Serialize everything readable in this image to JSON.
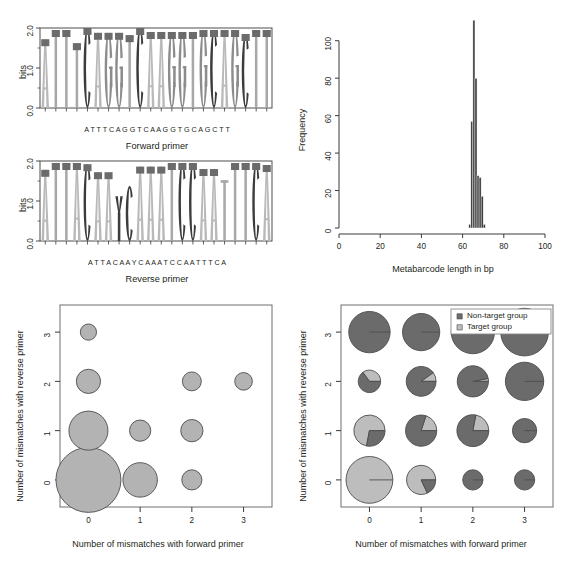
{
  "figure": {
    "title": "",
    "panels": [
      "sequence-logos",
      "metabarcode-length-histogram",
      "mismatch-bubble-plot",
      "mismatch-pie-plot"
    ]
  },
  "colors": {
    "base_A": "#b9b9b9",
    "base_T": "#a8a8a8",
    "base_C": "#3c3c3c",
    "base_G": "#8c8c8c",
    "base_Y": "#3c3c3c",
    "logo_box_cap": "#6b6b6b",
    "histogram_bar": "#3a3a3a",
    "bubble_fill": "#b3b3b3",
    "bubble_stroke": "#4d4d4d",
    "non_target": "#6b6b6b",
    "target": "#bdbdbd",
    "axis": "#3a3a3a",
    "text": "#231f20"
  },
  "logo_forward": {
    "caption": "Forward primer",
    "ylabel": "bits",
    "yticks": [
      "0.0",
      "1.0",
      "2.0"
    ],
    "ymax": 2.0,
    "sequence": [
      "A",
      "T",
      "T",
      "T",
      "C",
      "A",
      "G",
      "G",
      "T",
      "C",
      "A",
      "A",
      "G",
      "G",
      "T",
      "G",
      "C",
      "A",
      "G",
      "C",
      "T",
      "T"
    ],
    "sequence_text": "A T T T C A G G T C A A G G T G C A G C T T",
    "bits": [
      1.72,
      1.95,
      1.95,
      1.62,
      2.0,
      1.88,
      1.88,
      1.88,
      1.82,
      2.0,
      1.9,
      1.9,
      1.9,
      1.9,
      1.9,
      1.95,
      1.95,
      1.95,
      1.95,
      1.85,
      1.95,
      1.95
    ]
  },
  "logo_reverse": {
    "caption": "Reverse primer",
    "ylabel": "bits",
    "yticks": [
      "0.0",
      "1.0",
      "2.0"
    ],
    "ymax": 2.0,
    "sequence": [
      "A",
      "T",
      "T",
      "A",
      "C",
      "A",
      "A",
      "Y",
      "C",
      "A",
      "A",
      "A",
      "T",
      "C",
      "C",
      "A",
      "A",
      "T",
      "T",
      "T",
      "C",
      "A"
    ],
    "sequence_text": "A T T A C A A Y C A A A T C C A A T T T C A",
    "bits": [
      1.78,
      1.95,
      1.95,
      1.95,
      1.92,
      1.72,
      1.72,
      1.12,
      1.38,
      1.86,
      1.86,
      1.86,
      1.95,
      1.95,
      1.95,
      1.8,
      1.8,
      1.52,
      1.95,
      1.95,
      1.95,
      1.9
    ]
  },
  "chart_data": [
    {
      "type": "bar",
      "name": "metabarcode-length-histogram",
      "title": "",
      "xlabel": "Metabarcode length in bp",
      "ylabel": "Frequency",
      "xlim": [
        0,
        100
      ],
      "ylim": [
        0,
        110
      ],
      "xticks": [
        0,
        20,
        40,
        60,
        80,
        100
      ],
      "yticks": [
        0,
        20,
        40,
        60,
        80,
        100
      ],
      "grid": false,
      "categories": [
        63,
        64,
        65,
        66,
        67,
        68,
        69,
        70
      ],
      "values": [
        2,
        57,
        111,
        80,
        28,
        27,
        17,
        2
      ],
      "bin_width": 1
    },
    {
      "type": "scatter",
      "name": "mismatch-bubble-plot",
      "title": "",
      "xlabel": "Number of mismatches with forward primer",
      "ylabel": "Number of mismatches with reverse primer",
      "xlim": [
        -0.55,
        3.55
      ],
      "ylim": [
        -0.55,
        3.55
      ],
      "xticks": [
        0,
        1,
        2,
        3
      ],
      "yticks": [
        0,
        1,
        2,
        3
      ],
      "grid": false,
      "points": [
        {
          "x": 0,
          "y": 0,
          "size": 100
        },
        {
          "x": 1,
          "y": 0,
          "size": 25
        },
        {
          "x": 2,
          "y": 0,
          "size": 7
        },
        {
          "x": 0,
          "y": 1,
          "size": 33
        },
        {
          "x": 1,
          "y": 1,
          "size": 8
        },
        {
          "x": 2,
          "y": 1,
          "size": 9
        },
        {
          "x": 0,
          "y": 2,
          "size": 11
        },
        {
          "x": 2,
          "y": 2,
          "size": 6
        },
        {
          "x": 3,
          "y": 2,
          "size": 5
        },
        {
          "x": 0,
          "y": 3,
          "size": 4
        }
      ]
    },
    {
      "type": "pie",
      "name": "mismatch-pie-plot",
      "title": "",
      "xlabel": "Number of mismatches with forward primer",
      "ylabel": "Number of mismatches with reverse primer",
      "xlim": [
        -0.55,
        3.55
      ],
      "ylim": [
        -0.55,
        3.55
      ],
      "xticks": [
        0,
        1,
        2,
        3
      ],
      "yticks": [
        0,
        1,
        2,
        3
      ],
      "grid": false,
      "legend": {
        "position": "top-right",
        "entries": [
          {
            "label": "Non-target group",
            "color": "#6b6b6b"
          },
          {
            "label": "Target group",
            "color": "#bdbdbd"
          }
        ]
      },
      "points": [
        {
          "x": 0,
          "y": 0,
          "size": 50,
          "target_fraction": 1.0
        },
        {
          "x": 1,
          "y": 0,
          "size": 17,
          "target_fraction": 0.82
        },
        {
          "x": 2,
          "y": 0,
          "size": 7,
          "target_fraction": 0.0
        },
        {
          "x": 3,
          "y": 0,
          "size": 7,
          "target_fraction": 0.0
        },
        {
          "x": 0,
          "y": 1,
          "size": 20,
          "target_fraction": 0.72
        },
        {
          "x": 1,
          "y": 1,
          "size": 20,
          "target_fraction": 0.2
        },
        {
          "x": 2,
          "y": 1,
          "size": 21,
          "target_fraction": 0.22
        },
        {
          "x": 3,
          "y": 1,
          "size": 11,
          "target_fraction": 0.0
        },
        {
          "x": 0,
          "y": 2,
          "size": 9,
          "target_fraction": 0.35
        },
        {
          "x": 1,
          "y": 2,
          "size": 18,
          "target_fraction": 0.1
        },
        {
          "x": 2,
          "y": 2,
          "size": 20,
          "target_fraction": 0.03
        },
        {
          "x": 3,
          "y": 2,
          "size": 32,
          "target_fraction": 0.0
        },
        {
          "x": 0,
          "y": 3,
          "size": 38,
          "target_fraction": 0.0
        },
        {
          "x": 1,
          "y": 3,
          "size": 30,
          "target_fraction": 0.0
        },
        {
          "x": 2,
          "y": 3,
          "size": 42,
          "target_fraction": 0.0
        },
        {
          "x": 3,
          "y": 3,
          "size": 52,
          "target_fraction": 0.0
        }
      ]
    }
  ]
}
